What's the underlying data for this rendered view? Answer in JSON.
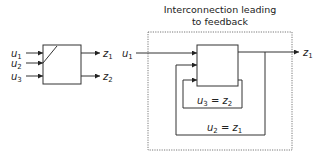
{
  "title": {
    "line1": "Interconnection leading",
    "line2": "to feedback"
  },
  "left_system": {
    "inputs": [
      {
        "var": "u",
        "sub": "1"
      },
      {
        "var": "u",
        "sub": "2"
      },
      {
        "var": "u",
        "sub": "3"
      }
    ],
    "outputs": [
      {
        "var": "z",
        "sub": "1"
      },
      {
        "var": "z",
        "sub": "2"
      }
    ]
  },
  "right_system": {
    "input": {
      "var": "u",
      "sub": "1"
    },
    "output": {
      "var": "z",
      "sub": "1"
    },
    "inner_loop": {
      "lhs_var": "u",
      "lhs_sub": "3",
      "eq": " = ",
      "rhs_var": "z",
      "rhs_sub": "2"
    },
    "outer_loop": {
      "lhs_var": "u",
      "lhs_sub": "2",
      "eq": " = ",
      "rhs_var": "z",
      "rhs_sub": "1"
    }
  },
  "colors": {
    "line": "#333333",
    "text": "#222222",
    "dotted_frame": "#555555"
  }
}
